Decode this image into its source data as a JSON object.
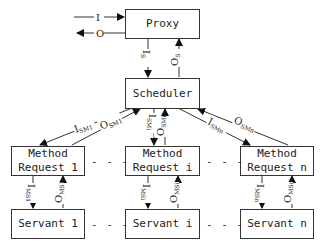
{
  "diagram": {
    "type": "active-object-pattern",
    "nodes": {
      "proxy": {
        "label": "Proxy"
      },
      "scheduler": {
        "label": "Scheduler"
      },
      "method_requests": [
        {
          "line1": "Method",
          "line2": "Request 1"
        },
        {
          "line1": "Method",
          "line2": "Request i"
        },
        {
          "line1": "Method",
          "line2": "Request n"
        }
      ],
      "servants": [
        {
          "label": "Servant 1"
        },
        {
          "label": "Servant i"
        },
        {
          "label": "Servant n"
        }
      ]
    },
    "edges": {
      "external_in": {
        "main": "I",
        "sub": ""
      },
      "external_out": {
        "main": "O",
        "sub": ""
      },
      "proxy_to_scheduler": {
        "main": "I",
        "sub": "S"
      },
      "scheduler_to_proxy": {
        "main": "O",
        "sub": "S"
      },
      "sched_to_mr1": {
        "main": "I",
        "sub": "SM1"
      },
      "mr1_to_sched": {
        "main": "O",
        "sub": "SM1"
      },
      "sched_to_mri": {
        "main": "I",
        "sub": "SMi"
      },
      "mri_to_sched": {
        "main": "O",
        "sub": "SMi"
      },
      "sched_to_mrn": {
        "main": "I",
        "sub": "SMn"
      },
      "mrn_to_sched": {
        "main": "O",
        "sub": "SMn"
      },
      "mr1_to_servant1": {
        "main": "I",
        "sub": "MS1"
      },
      "servant1_to_mr1": {
        "main": "O",
        "sub": "MS1"
      },
      "mri_to_servanti": {
        "main": "I",
        "sub": "MSi"
      },
      "servanti_to_mri": {
        "main": "O",
        "sub": "MSi"
      },
      "mrn_to_servantn": {
        "main": "I",
        "sub": "MSn"
      },
      "servantn_to_mrn": {
        "main": "O",
        "sub": "MSn"
      }
    },
    "ellipsis": "- - -"
  }
}
